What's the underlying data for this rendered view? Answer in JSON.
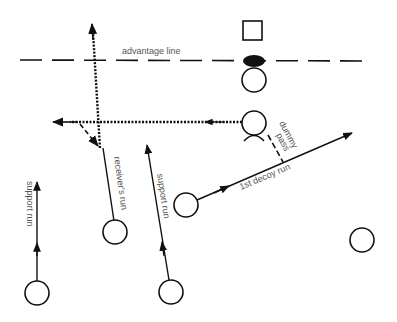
{
  "diagram": {
    "type": "rugby-play",
    "colors": {
      "ink": "#111111",
      "label": "#555555",
      "background": "#ffffff"
    },
    "labels": {
      "advantage_line": "advantage line",
      "dummy_pass_1": "dummy",
      "dummy_pass_2": "pass",
      "receivers_run": "receiver's run",
      "support_run_left": "support run",
      "support_run_middle": "support run",
      "first_decoy_run": "1st decoy run"
    },
    "players": [
      {
        "id": "opponent",
        "shape": "square"
      },
      {
        "id": "scrum-half",
        "shape": "circle"
      },
      {
        "id": "passer",
        "shape": "circle"
      },
      {
        "id": "first-decoy",
        "shape": "circle"
      },
      {
        "id": "receiver",
        "shape": "circle"
      },
      {
        "id": "support-left",
        "shape": "circle"
      },
      {
        "id": "support-middle",
        "shape": "circle"
      },
      {
        "id": "winger",
        "shape": "circle"
      }
    ],
    "ball": {
      "shape": "filled-ellipse"
    }
  }
}
